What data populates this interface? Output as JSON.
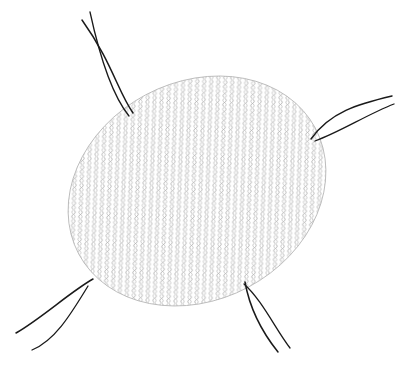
{
  "image": {
    "subject": "mesh-net-pad-with-four-strings",
    "background": "#ffffff",
    "mesh_color": "#9a9a9a",
    "string_color": "#1a1a1a"
  },
  "ellipse": {
    "cx": 197,
    "cy": 191,
    "rx": 134,
    "ry": 109,
    "rotate": -28
  },
  "strings": [
    {
      "name": "top-left",
      "path1": "M133,113 C110,85 105,50 80,18",
      "path2": "M128,116 C110,90 100,55 88,12"
    },
    {
      "name": "top-right",
      "path1": "M311,139 C330,115 360,105 395,96",
      "path2": "M314,140 C340,128 370,112 395,104"
    },
    {
      "name": "bottom-left",
      "path1": "M93,279 C70,295 40,320 10,333",
      "path2": "M88,285 C70,310 50,345 30,350"
    },
    {
      "name": "bottom-right",
      "path1": "M246,282 C250,310 262,330 280,350",
      "path2": "M244,283 C258,300 278,330 290,348"
    }
  ]
}
